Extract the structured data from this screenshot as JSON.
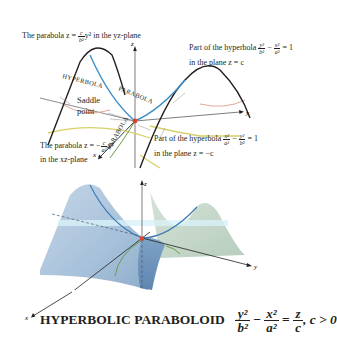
{
  "top_diagram": {
    "annotation_yz_parabola": {
      "prefix": "The parabola z = ",
      "frac_num": "c",
      "frac_den": "b²",
      "suffix": "y² in the yz-plane"
    },
    "annotation_hyperbola_z_c": {
      "prefix": "Part of the hyperbola",
      "frac1_num": "y²",
      "frac1_den": "b²",
      "minus": "−",
      "frac2_num": "x²",
      "frac2_den": "a²",
      "equals": "= 1",
      "line2": "in the plane z = c"
    },
    "annotation_saddle": {
      "line1": "Saddle",
      "line2": "point"
    },
    "annotation_xz_parabola": {
      "prefix": "The parabola z = −",
      "frac_num": "c",
      "frac_den": "a²",
      "suffix": "x²",
      "line2": "in the xz-plane"
    },
    "annotation_hyperbola_z_neg_c": {
      "prefix": "Part of the hyperbola",
      "frac1_num": "x²",
      "frac1_den": "a²",
      "minus": "−",
      "frac2_num": "y²",
      "frac2_den": "b²",
      "equals": "= 1",
      "line2": "in the plane z = −c"
    },
    "curve_labels": {
      "hyperbola": "HYPERBOLA",
      "parabola_top": "PARABOLA",
      "parabola_bottom": "PARABOLA"
    },
    "axes": {
      "x": "x",
      "y": "y",
      "z": "z"
    }
  },
  "bottom_diagram": {
    "axes": {
      "x": "x",
      "y": "y",
      "z": "z"
    }
  },
  "caption": {
    "title": "HYPERBOLIC PARABOLOID",
    "frac1_num": "y²",
    "frac1_den": "b²",
    "minus": "−",
    "frac2_num": "x²",
    "frac2_den": "a²",
    "equals": "=",
    "frac3_num": "z",
    "frac3_den": "c",
    "condition": ", c > 0"
  },
  "colors": {
    "curve_black": "#231f20",
    "parabola_blue": "#3a8fc8",
    "hyperbola_pink": "#e2a79a",
    "hyperbola_yellow": "#d9cf6a",
    "parabola_green": "#6a9a4a",
    "saddle_red": "#d8432a",
    "surface_blue": "#9fbcd6",
    "surface_green": "#bdd3c4"
  }
}
